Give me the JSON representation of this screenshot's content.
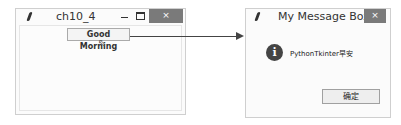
{
  "main_window": {
    "title": "ch10_4",
    "controls": {
      "minimize": "—",
      "maximize": "☐",
      "close": "×"
    },
    "button_label": "Good Morning"
  },
  "message_box": {
    "title": "My Message Box",
    "close": "×",
    "icon": "info-icon",
    "icon_glyph": "i",
    "message": "PythonTkinter早安",
    "ok_label": "确定"
  },
  "cursor_glyph": "⇖"
}
